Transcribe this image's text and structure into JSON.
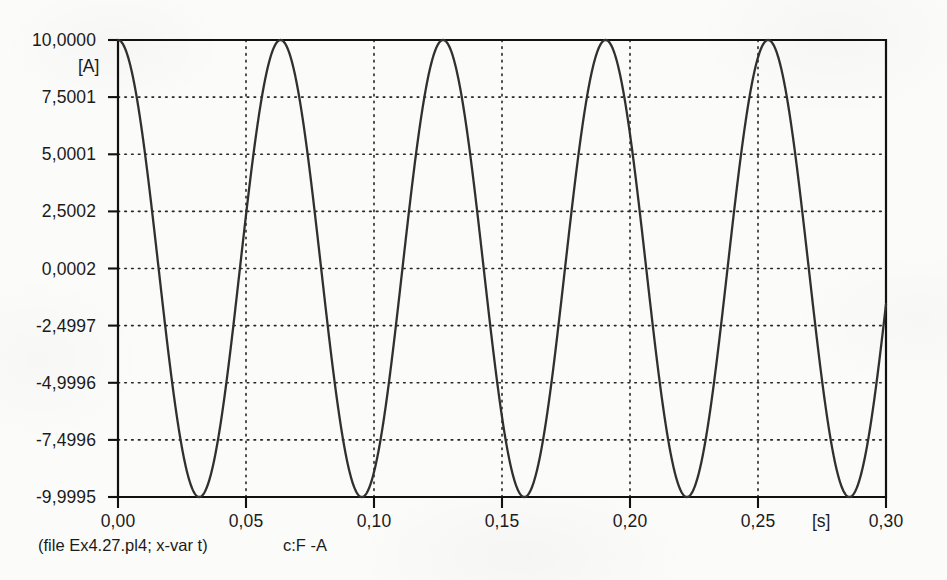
{
  "chart_data": {
    "type": "line",
    "title": "",
    "subtitle": "",
    "xlabel": "[s]",
    "ylabel": "[A]",
    "xlim": [
      0.0,
      0.3
    ],
    "ylim": [
      -9.9995,
      10.0
    ],
    "grid": true,
    "grid_style": "dotted",
    "legend_position": "below-axes",
    "x_ticks": [
      0.0,
      0.05,
      0.1,
      0.15,
      0.2,
      0.25,
      0.3
    ],
    "x_tick_labels": [
      "0,00",
      "0,05",
      "0,10",
      "0,15",
      "0,20",
      "0,25",
      "0,30"
    ],
    "y_ticks": [
      10.0,
      7.5001,
      5.0001,
      2.5002,
      0.0002,
      -2.4997,
      -4.9996,
      -7.4996,
      -9.9995
    ],
    "y_tick_labels": [
      "10,0000",
      "7,5001",
      "5,0001",
      "2,5002",
      "0,0002",
      "-2,4997",
      "-4,9996",
      "-7,4996",
      "-9,9995"
    ],
    "series": [
      {
        "name": "c:F    -A",
        "color": "#303030",
        "waveform": "cosine",
        "amplitude": 9.99975,
        "offset": 0.00025,
        "frequency_hz": 15.75,
        "phase_deg": 0,
        "period_s": 0.0635,
        "peaks_t": [
          0.0,
          0.0635,
          0.127,
          0.1905,
          0.254
        ],
        "peaks_y": [
          10.0,
          10.0,
          10.0,
          10.0,
          10.0
        ],
        "minima_t": [
          0.03175,
          0.09525,
          0.14875,
          0.2225,
          0.286
        ],
        "minima_y": [
          -9.9995,
          -9.9995,
          -9.9995,
          -9.9995,
          -9.9995
        ],
        "n_cycles": 4.72
      }
    ],
    "annotations": {
      "file_caption": "(file Ex4.27.pl4; x-var t)",
      "legend_entry": "c:F    -A"
    }
  },
  "axes": {
    "y_unit": "[A]",
    "x_unit": "[s]"
  }
}
